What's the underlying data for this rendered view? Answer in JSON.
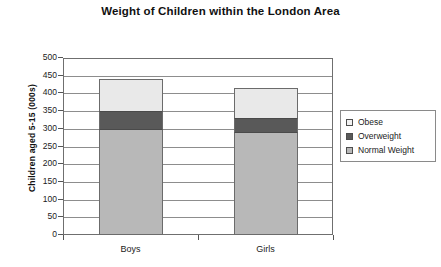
{
  "chart_data": {
    "type": "bar",
    "subtype": "stacked-bar",
    "title": "Weight of Children within the London Area",
    "xlabel": "",
    "ylabel": "Children aged 5-15 (000s)",
    "categories": [
      "Boys",
      "Girls"
    ],
    "ylim": [
      0,
      500
    ],
    "ytick_step": 50,
    "ytick_labels": [
      "500",
      "450",
      "400",
      "350",
      "300",
      "250",
      "200",
      "150",
      "100",
      "50",
      "0"
    ],
    "ytick_values": [
      500,
      450,
      400,
      350,
      300,
      250,
      200,
      150,
      100,
      50,
      0
    ],
    "grid": "horizontal",
    "legend_position": "right",
    "series": [
      {
        "name": "Normal Weight",
        "values": [
          300,
          290
        ],
        "color": "#b8b8b8"
      },
      {
        "name": "Overweight",
        "values": [
          50,
          40
        ],
        "color": "#595959"
      },
      {
        "name": "Obese",
        "values": [
          90,
          85
        ],
        "color": "#e9e9e9"
      }
    ],
    "stack_order_bottom_to_top": [
      "Normal Weight",
      "Overweight",
      "Obese"
    ],
    "totals": [
      440,
      415
    ]
  },
  "legend": {
    "items": [
      {
        "label": "Obese",
        "color": "#f2f2f2"
      },
      {
        "label": "Overweight",
        "color": "#595959"
      },
      {
        "label": "Normal Weight",
        "color": "#b8b8b8"
      }
    ]
  }
}
